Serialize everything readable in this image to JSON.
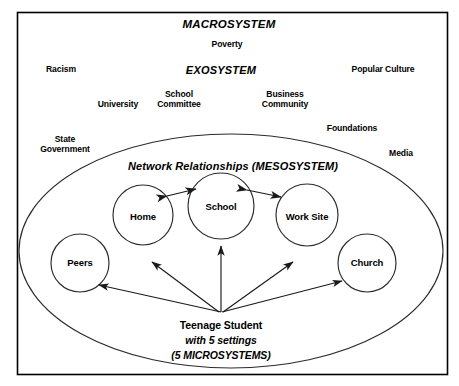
{
  "diagram": {
    "title": "MACROSYSTEM",
    "border_color": "#000000",
    "line_color": "#1a1a1a",
    "background": "#ffffff",
    "frame": {
      "x": 17,
      "y": 12,
      "width": 431,
      "height": 363
    },
    "macro_label": {
      "text": "MACROSYSTEM",
      "x": 229,
      "y": 24,
      "style": "bold-italic"
    },
    "exo_label": {
      "text": "EXOSYSTEM",
      "x": 221,
      "y": 70,
      "style": "bold-italic"
    },
    "meso_label": {
      "text": "Network Relationships (MESOSYSTEM)",
      "x": 233,
      "y": 166,
      "style": "bold-italic"
    },
    "macro_factors": [
      {
        "label": "Poverty",
        "x": 227,
        "y": 45
      },
      {
        "label": "Racism",
        "x": 61,
        "y": 70
      },
      {
        "label": "Popular Culture",
        "x": 383,
        "y": 70
      },
      {
        "label": "State\nGovernment",
        "x": 65,
        "y": 145
      },
      {
        "label": "Media",
        "x": 401,
        "y": 154
      }
    ],
    "exo_factors": [
      {
        "label": "University",
        "x": 118,
        "y": 105
      },
      {
        "label": "School\nCommittee",
        "x": 179,
        "y": 100
      },
      {
        "label": "Business\nCommunity",
        "x": 285,
        "y": 100
      },
      {
        "label": "Foundations",
        "x": 352,
        "y": 129
      }
    ],
    "mesosystem_ellipse": {
      "cx": 231,
      "cy": 251,
      "rx": 212,
      "ry": 117
    },
    "microsystems": [
      {
        "name": "Peers",
        "label": "Peers",
        "cx": 80,
        "cy": 263,
        "r": 29
      },
      {
        "name": "Home",
        "label": "Home",
        "cx": 143,
        "cy": 215,
        "r": 30
      },
      {
        "name": "School",
        "label": "School",
        "cx": 221,
        "cy": 206,
        "r": 33
      },
      {
        "name": "Work Site",
        "label": "Work Site",
        "cx": 307,
        "cy": 215,
        "r": 31
      },
      {
        "name": "Church",
        "label": "Church",
        "cx": 367,
        "cy": 263,
        "r": 29
      }
    ],
    "network_links": [
      {
        "from": "Home",
        "to": "School",
        "type": "bidirectional"
      },
      {
        "from": "School",
        "to": "Work Site",
        "type": "bidirectional"
      }
    ],
    "student": {
      "line1": "Teenage Student",
      "line2": "with 5 settings",
      "line3": "(5 MICROSYSTEMS)",
      "x": 221,
      "y": 325,
      "origin": {
        "x": 221,
        "y": 312
      },
      "arrow_targets": [
        "Peers",
        "Home",
        "School",
        "Work Site",
        "Church"
      ],
      "arrow_count": 5
    }
  }
}
